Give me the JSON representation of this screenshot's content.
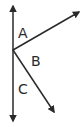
{
  "diagram": {
    "type": "angles-on-a-line",
    "labels": {
      "angle_a": "A",
      "angle_b": "B",
      "angle_c": "C"
    },
    "stroke_color": "#2a2a2a",
    "background": "#ffffff"
  }
}
